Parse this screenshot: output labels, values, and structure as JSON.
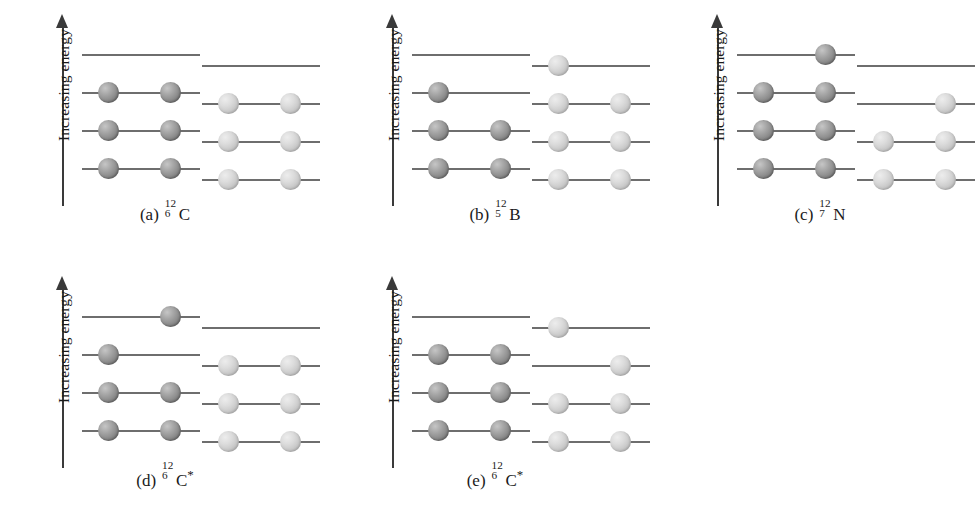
{
  "figure": {
    "axis_label": "Increasing energy",
    "colors": {
      "neutron": "#8a8a8a",
      "proton": "#cfcfcf",
      "level_line": "#6e6e6e",
      "axis": "#3a3a3a",
      "background": "#ffffff"
    }
  },
  "chart_data": {
    "type": "diagram",
    "ylabel": "Increasing energy",
    "grid": false,
    "legend": [],
    "level_count": 4,
    "slots_per_level": 2,
    "panels": [
      {
        "tag": "(a)",
        "mass_number": "12",
        "atomic_number": "6",
        "symbol": "C",
        "excited": false,
        "neutron_count": 6,
        "proton_count": 6,
        "neutrons": [
          {
            "level": 0,
            "slots": [
              "left",
              "right"
            ]
          },
          {
            "level": 1,
            "slots": [
              "left",
              "right"
            ]
          },
          {
            "level": 2,
            "slots": [
              "left",
              "right"
            ]
          },
          {
            "level": 3,
            "slots": []
          }
        ],
        "protons": [
          {
            "level": 0,
            "slots": [
              "left",
              "right"
            ]
          },
          {
            "level": 1,
            "slots": [
              "left",
              "right"
            ]
          },
          {
            "level": 2,
            "slots": [
              "left",
              "right"
            ]
          },
          {
            "level": 3,
            "slots": []
          }
        ]
      },
      {
        "tag": "(b)",
        "mass_number": "12",
        "atomic_number": "5",
        "symbol": "B",
        "excited": false,
        "neutron_count": 7,
        "proton_count": 5,
        "neutrons": [
          {
            "level": 0,
            "slots": [
              "left",
              "right"
            ]
          },
          {
            "level": 1,
            "slots": [
              "left",
              "right"
            ]
          },
          {
            "level": 2,
            "slots": [
              "left"
            ]
          },
          {
            "level": 3,
            "slots": []
          }
        ],
        "protons": [
          {
            "level": 0,
            "slots": [
              "left",
              "right"
            ]
          },
          {
            "level": 1,
            "slots": [
              "left",
              "right"
            ]
          },
          {
            "level": 2,
            "slots": [
              "left",
              "right"
            ]
          },
          {
            "level": 3,
            "slots": [
              "left"
            ]
          }
        ]
      },
      {
        "tag": "(c)",
        "mass_number": "12",
        "atomic_number": "7",
        "symbol": "N",
        "excited": false,
        "neutron_count": 7,
        "proton_count": 5,
        "neutrons": [
          {
            "level": 0,
            "slots": [
              "left",
              "right"
            ]
          },
          {
            "level": 1,
            "slots": [
              "left",
              "right"
            ]
          },
          {
            "level": 2,
            "slots": [
              "left",
              "right"
            ]
          },
          {
            "level": 3,
            "slots": [
              "right"
            ]
          }
        ],
        "protons": [
          {
            "level": 0,
            "slots": [
              "left",
              "right"
            ]
          },
          {
            "level": 1,
            "slots": [
              "left",
              "right"
            ]
          },
          {
            "level": 2,
            "slots": [
              "right"
            ]
          },
          {
            "level": 3,
            "slots": []
          }
        ]
      },
      {
        "tag": "(d)",
        "mass_number": "12",
        "atomic_number": "6",
        "symbol": "C",
        "excited": true,
        "neutron_count": 6,
        "proton_count": 6,
        "neutrons": [
          {
            "level": 0,
            "slots": [
              "left",
              "right"
            ]
          },
          {
            "level": 1,
            "slots": [
              "left",
              "right"
            ]
          },
          {
            "level": 2,
            "slots": [
              "left"
            ]
          },
          {
            "level": 3,
            "slots": [
              "right"
            ]
          }
        ],
        "protons": [
          {
            "level": 0,
            "slots": [
              "left",
              "right"
            ]
          },
          {
            "level": 1,
            "slots": [
              "left",
              "right"
            ]
          },
          {
            "level": 2,
            "slots": [
              "left",
              "right"
            ]
          },
          {
            "level": 3,
            "slots": []
          }
        ]
      },
      {
        "tag": "(e)",
        "mass_number": "12",
        "atomic_number": "6",
        "symbol": "C",
        "excited": true,
        "neutron_count": 6,
        "proton_count": 6,
        "neutrons": [
          {
            "level": 0,
            "slots": [
              "left",
              "right"
            ]
          },
          {
            "level": 1,
            "slots": [
              "left",
              "right"
            ]
          },
          {
            "level": 2,
            "slots": [
              "left",
              "right"
            ]
          },
          {
            "level": 3,
            "slots": []
          }
        ],
        "protons": [
          {
            "level": 0,
            "slots": [
              "left",
              "right"
            ]
          },
          {
            "level": 1,
            "slots": [
              "left",
              "right"
            ]
          },
          {
            "level": 2,
            "slots": [
              "right"
            ]
          },
          {
            "level": 3,
            "slots": [
              "left"
            ]
          }
        ]
      }
    ],
    "panel_positions": [
      {
        "x": 0,
        "y": 0
      },
      {
        "x": 330,
        "y": 0
      },
      {
        "x": 655,
        "y": 0
      },
      {
        "x": 0,
        "y": 262
      },
      {
        "x": 330,
        "y": 262
      }
    ]
  }
}
